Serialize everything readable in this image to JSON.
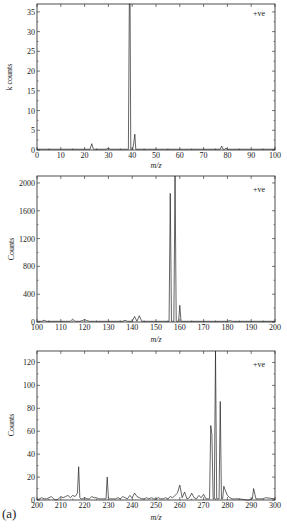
{
  "figure": {
    "panel_label": "(a)",
    "line_color": "#222222",
    "background": "#ffffff"
  },
  "chart_data": [
    {
      "type": "line",
      "title": "",
      "annotation": "+ve",
      "xlabel": "m/z",
      "ylabel": "k counts",
      "xlim": [
        0,
        100
      ],
      "ylim": [
        0,
        37
      ],
      "xticks": [
        0,
        10,
        20,
        30,
        40,
        50,
        60,
        70,
        80,
        90,
        100
      ],
      "yticks": [
        0,
        5,
        10,
        15,
        20,
        25,
        30,
        35
      ],
      "grid": false,
      "legend": "none",
      "series": [
        {
          "name": "spectrum",
          "x": [
            0,
            22.3,
            23,
            23.7,
            29,
            30,
            31,
            38,
            38.4,
            38.8,
            39.1,
            39.4,
            39.8,
            40.2,
            40.7,
            41.1,
            41.5,
            42,
            77,
            77.6,
            78.2,
            78.8,
            79.4,
            80,
            100
          ],
          "y": [
            0.2,
            0.2,
            1.6,
            0.2,
            0.2,
            0.4,
            0.2,
            0.2,
            0.2,
            37,
            37,
            0.2,
            0.2,
            0.2,
            2,
            4,
            0.2,
            0.2,
            0.2,
            1,
            0.2,
            0.2,
            0.5,
            0.2,
            0.2
          ]
        }
      ],
      "peaks": [
        {
          "mz": 23,
          "value": 1.6
        },
        {
          "mz": 39,
          "value": 37
        },
        {
          "mz": 41,
          "value": 4
        },
        {
          "mz": 78,
          "value": 1
        }
      ]
    },
    {
      "type": "line",
      "title": "",
      "annotation": "+ve",
      "xlabel": "m/z",
      "ylabel": "Counts",
      "xlim": [
        100,
        200
      ],
      "ylim": [
        0,
        2100
      ],
      "xticks": [
        100,
        110,
        120,
        130,
        140,
        150,
        160,
        170,
        180,
        190,
        200
      ],
      "yticks": [
        0,
        400,
        800,
        1200,
        1600,
        2000
      ],
      "grid": false,
      "legend": "none",
      "series": [
        {
          "name": "spectrum",
          "x": [
            100,
            102,
            103,
            104,
            106,
            110,
            112,
            114,
            115,
            116,
            118,
            119,
            120,
            121,
            122,
            124,
            130,
            136,
            137,
            138,
            140,
            141,
            142,
            143,
            144,
            155,
            155.5,
            156,
            156.5,
            157,
            157.5,
            158,
            158.5,
            159,
            159.5,
            160,
            160.5,
            161,
            170,
            180,
            181,
            182,
            200
          ],
          "y": [
            10,
            10,
            25,
            10,
            10,
            10,
            10,
            10,
            40,
            10,
            10,
            20,
            35,
            20,
            10,
            10,
            10,
            10,
            25,
            10,
            10,
            80,
            10,
            90,
            10,
            10,
            10,
            1850,
            10,
            10,
            10,
            2100,
            10,
            10,
            10,
            240,
            10,
            10,
            10,
            10,
            20,
            10,
            10
          ]
        }
      ],
      "peaks": [
        {
          "mz": 141,
          "value": 80
        },
        {
          "mz": 143,
          "value": 90
        },
        {
          "mz": 156,
          "value": 1850
        },
        {
          "mz": 158,
          "value": 2100
        },
        {
          "mz": 160,
          "value": 240
        }
      ]
    },
    {
      "type": "line",
      "title": "",
      "annotation": "+ve",
      "xlabel": "m/z",
      "ylabel": "Counts",
      "xlim": [
        200,
        300
      ],
      "ylim": [
        0,
        130
      ],
      "xticks": [
        200,
        210,
        220,
        230,
        240,
        250,
        260,
        270,
        280,
        290,
        300
      ],
      "yticks": [
        0,
        20,
        40,
        60,
        80,
        100,
        120
      ],
      "grid": false,
      "legend": "none",
      "series": [
        {
          "name": "spectrum",
          "x": [
            200,
            201,
            202,
            203,
            204,
            205,
            206,
            207,
            208,
            209,
            210,
            211,
            212,
            213,
            214,
            215,
            216,
            217,
            217.5,
            218,
            218.5,
            219,
            220,
            221,
            222,
            223,
            224,
            225,
            226,
            227,
            228,
            229,
            229.5,
            230,
            230.5,
            231,
            232,
            233,
            234,
            235,
            236,
            237,
            238,
            239,
            240,
            241,
            242,
            243,
            244,
            245,
            246,
            247,
            248,
            249,
            250,
            251,
            252,
            253,
            254,
            255,
            256,
            257,
            258,
            259,
            260,
            261,
            262,
            263,
            264,
            265,
            266,
            267,
            268,
            269,
            270,
            271,
            272,
            272.5,
            273,
            273.5,
            274,
            274.5,
            275,
            275.5,
            276,
            276.5,
            277,
            277.5,
            278,
            278.5,
            279,
            280,
            281,
            282,
            283,
            285,
            288,
            289,
            290,
            290.5,
            291,
            292,
            293,
            294,
            295,
            296,
            300
          ],
          "y": [
            0,
            1,
            2,
            1,
            1,
            2,
            3,
            1,
            0,
            1,
            3,
            2,
            3,
            4,
            2,
            4,
            3,
            6,
            29,
            2,
            1,
            1,
            2,
            1,
            1,
            3,
            2,
            2,
            1,
            1,
            1,
            1,
            20,
            2,
            1,
            1,
            1,
            1,
            2,
            1,
            3,
            2,
            1,
            4,
            2,
            6,
            3,
            2,
            1,
            1,
            2,
            1,
            2,
            1,
            1,
            2,
            1,
            1,
            2,
            1,
            3,
            2,
            4,
            6,
            13,
            2,
            7,
            1,
            2,
            6,
            2,
            1,
            4,
            2,
            5,
            1,
            1,
            1,
            65,
            57,
            1,
            1,
            130,
            1,
            1,
            1,
            86,
            1,
            1,
            12,
            9,
            4,
            2,
            1,
            1,
            1,
            0,
            0,
            1,
            1,
            10,
            1,
            1,
            1,
            1,
            2,
            1,
            0,
            0
          ]
        }
      ],
      "peaks": [
        {
          "mz": 217.5,
          "value": 29
        },
        {
          "mz": 229.5,
          "value": 20
        },
        {
          "mz": 260,
          "value": 13
        },
        {
          "mz": 273,
          "value": 65
        },
        {
          "mz": 275,
          "value": 130
        },
        {
          "mz": 277,
          "value": 86
        },
        {
          "mz": 278.5,
          "value": 12
        },
        {
          "mz": 290.5,
          "value": 10
        }
      ]
    }
  ]
}
